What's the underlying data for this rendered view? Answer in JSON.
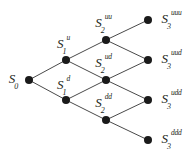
{
  "diagram": {
    "type": "recombining-binomial-tree",
    "background_color": "#ffffff",
    "node_color": "#1a1a1a",
    "edge_color": "#4a4a4a",
    "label_color": "#231f20",
    "node_radius": 4,
    "edge_width": 1,
    "canvas": {
      "width": 192,
      "height": 158
    },
    "steps": 3
  },
  "nodes": [
    {
      "id": "S0",
      "base": "S",
      "sub": "0",
      "sup": "",
      "x": 29,
      "y": 80,
      "label_x": 14,
      "label_y": 80,
      "label_position": "left"
    },
    {
      "id": "S1u",
      "base": "S",
      "sub": "1",
      "sup": "u",
      "x": 66,
      "y": 60,
      "label_x": 64,
      "label_y": 45,
      "label_position": "above"
    },
    {
      "id": "S1d",
      "base": "S",
      "sub": "1",
      "sup": "d",
      "x": 66,
      "y": 100,
      "label_x": 64,
      "label_y": 86,
      "label_position": "above"
    },
    {
      "id": "S2uu",
      "base": "S",
      "sub": "2",
      "sup": "uu",
      "x": 106,
      "y": 40,
      "label_x": 104,
      "label_y": 24,
      "label_position": "above"
    },
    {
      "id": "S2ud",
      "base": "S",
      "sub": "2",
      "sup": "ud",
      "x": 106,
      "y": 80,
      "label_x": 104,
      "label_y": 64,
      "label_position": "above"
    },
    {
      "id": "S2dd",
      "base": "S",
      "sub": "2",
      "sup": "dd",
      "x": 106,
      "y": 120,
      "label_x": 104,
      "label_y": 104,
      "label_position": "above"
    },
    {
      "id": "S3uuu",
      "base": "S",
      "sub": "3",
      "sup": "uuu",
      "x": 148,
      "y": 20,
      "label_x": 172,
      "label_y": 20,
      "label_position": "right"
    },
    {
      "id": "S3uud",
      "base": "S",
      "sub": "3",
      "sup": "uud",
      "x": 148,
      "y": 60,
      "label_x": 172,
      "label_y": 60,
      "label_position": "right"
    },
    {
      "id": "S3udd",
      "base": "S",
      "sub": "3",
      "sup": "udd",
      "x": 148,
      "y": 100,
      "label_x": 172,
      "label_y": 100,
      "label_position": "right"
    },
    {
      "id": "S3ddd",
      "base": "S",
      "sub": "3",
      "sup": "ddd",
      "x": 148,
      "y": 140,
      "label_x": 172,
      "label_y": 140,
      "label_position": "right"
    }
  ],
  "edges": [
    {
      "from": "S0",
      "to": "S1u",
      "move": "u"
    },
    {
      "from": "S0",
      "to": "S1d",
      "move": "d"
    },
    {
      "from": "S1u",
      "to": "S2uu",
      "move": "u"
    },
    {
      "from": "S1u",
      "to": "S2ud",
      "move": "d"
    },
    {
      "from": "S1d",
      "to": "S2ud",
      "move": "u"
    },
    {
      "from": "S1d",
      "to": "S2dd",
      "move": "d"
    },
    {
      "from": "S2uu",
      "to": "S3uuu",
      "move": "u"
    },
    {
      "from": "S2uu",
      "to": "S3uud",
      "move": "d"
    },
    {
      "from": "S2ud",
      "to": "S3uud",
      "move": "u"
    },
    {
      "from": "S2ud",
      "to": "S3udd",
      "move": "d"
    },
    {
      "from": "S2dd",
      "to": "S3udd",
      "move": "u"
    },
    {
      "from": "S2dd",
      "to": "S3ddd",
      "move": "d"
    }
  ]
}
